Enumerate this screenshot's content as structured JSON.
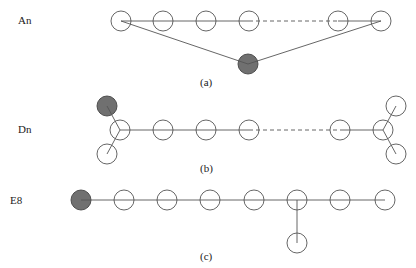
{
  "diagrams": [
    {
      "id": "a",
      "name": "An",
      "caption": "(a)",
      "label_pos": [
        18,
        24
      ],
      "caption_pos": [
        200,
        86
      ],
      "nodes": [
        {
          "x": 121,
          "y": 21,
          "shaded": false
        },
        {
          "x": 163,
          "y": 21,
          "shaded": false
        },
        {
          "x": 206,
          "y": 21,
          "shaded": false
        },
        {
          "x": 249,
          "y": 21,
          "shaded": false
        },
        {
          "x": 338,
          "y": 21,
          "shaded": false
        },
        {
          "x": 381,
          "y": 21,
          "shaded": false
        },
        {
          "x": 248,
          "y": 64,
          "shaded": true
        }
      ],
      "edges": [
        {
          "from": 0,
          "to": 1,
          "dashed": false
        },
        {
          "from": 1,
          "to": 2,
          "dashed": false
        },
        {
          "from": 2,
          "to": 3,
          "dashed": false
        },
        {
          "from": 3,
          "to": 4,
          "dashed": true
        },
        {
          "from": 4,
          "to": 5,
          "dashed": false
        },
        {
          "from": 0,
          "to": 6,
          "dashed": false
        },
        {
          "from": 5,
          "to": 6,
          "dashed": false
        }
      ]
    },
    {
      "id": "b",
      "name": "Dn",
      "caption": "(b)",
      "label_pos": [
        18,
        133
      ],
      "caption_pos": [
        200,
        172
      ],
      "nodes": [
        {
          "x": 107,
          "y": 106,
          "shaded": true
        },
        {
          "x": 120,
          "y": 130,
          "shaded": false
        },
        {
          "x": 107,
          "y": 154,
          "shaded": false
        },
        {
          "x": 163,
          "y": 130,
          "shaded": false
        },
        {
          "x": 206,
          "y": 130,
          "shaded": false
        },
        {
          "x": 249,
          "y": 130,
          "shaded": false
        },
        {
          "x": 340,
          "y": 130,
          "shaded": false
        },
        {
          "x": 383,
          "y": 130,
          "shaded": false
        },
        {
          "x": 396,
          "y": 106,
          "shaded": false
        },
        {
          "x": 396,
          "y": 154,
          "shaded": false
        }
      ],
      "edges": [
        {
          "from": 0,
          "to": 1,
          "dashed": false
        },
        {
          "from": 2,
          "to": 1,
          "dashed": false
        },
        {
          "from": 1,
          "to": 3,
          "dashed": false
        },
        {
          "from": 3,
          "to": 4,
          "dashed": false
        },
        {
          "from": 4,
          "to": 5,
          "dashed": false
        },
        {
          "from": 5,
          "to": 6,
          "dashed": true
        },
        {
          "from": 6,
          "to": 7,
          "dashed": false
        },
        {
          "from": 7,
          "to": 8,
          "dashed": false
        },
        {
          "from": 7,
          "to": 9,
          "dashed": false
        }
      ]
    },
    {
      "id": "c",
      "name": "E8",
      "caption": "(c)",
      "label_pos": [
        10,
        204
      ],
      "caption_pos": [
        200,
        260
      ],
      "nodes": [
        {
          "x": 81,
          "y": 200,
          "shaded": true
        },
        {
          "x": 124,
          "y": 200,
          "shaded": false
        },
        {
          "x": 167,
          "y": 200,
          "shaded": false
        },
        {
          "x": 210,
          "y": 200,
          "shaded": false
        },
        {
          "x": 254,
          "y": 200,
          "shaded": false
        },
        {
          "x": 297,
          "y": 200,
          "shaded": false
        },
        {
          "x": 340,
          "y": 200,
          "shaded": false
        },
        {
          "x": 385,
          "y": 200,
          "shaded": false
        },
        {
          "x": 297,
          "y": 243,
          "shaded": false
        }
      ],
      "edges": [
        {
          "from": 0,
          "to": 1,
          "dashed": false
        },
        {
          "from": 1,
          "to": 2,
          "dashed": false
        },
        {
          "from": 2,
          "to": 3,
          "dashed": false
        },
        {
          "from": 3,
          "to": 4,
          "dashed": false
        },
        {
          "from": 4,
          "to": 5,
          "dashed": false
        },
        {
          "from": 5,
          "to": 6,
          "dashed": false
        },
        {
          "from": 6,
          "to": 7,
          "dashed": false
        },
        {
          "from": 5,
          "to": 8,
          "dashed": false
        }
      ]
    }
  ],
  "node_radius": 10
}
